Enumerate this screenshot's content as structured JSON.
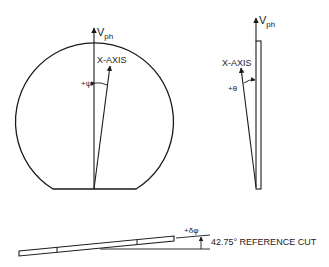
{
  "left_view": {
    "vph_label": "V",
    "vph_sub": "ph",
    "x_axis_label": "X-AXIS",
    "angle_label": "+ψ"
  },
  "right_view": {
    "vph_label": "V",
    "vph_sub": "ph",
    "x_axis_label": "X-AXIS",
    "angle_label": "+θ"
  },
  "bottom_view": {
    "angle_label": "+δφ",
    "reference_label": "42.75° REFERENCE CUT"
  },
  "colors": {
    "stroke": "#1a1a1a",
    "background": "#ffffff"
  }
}
